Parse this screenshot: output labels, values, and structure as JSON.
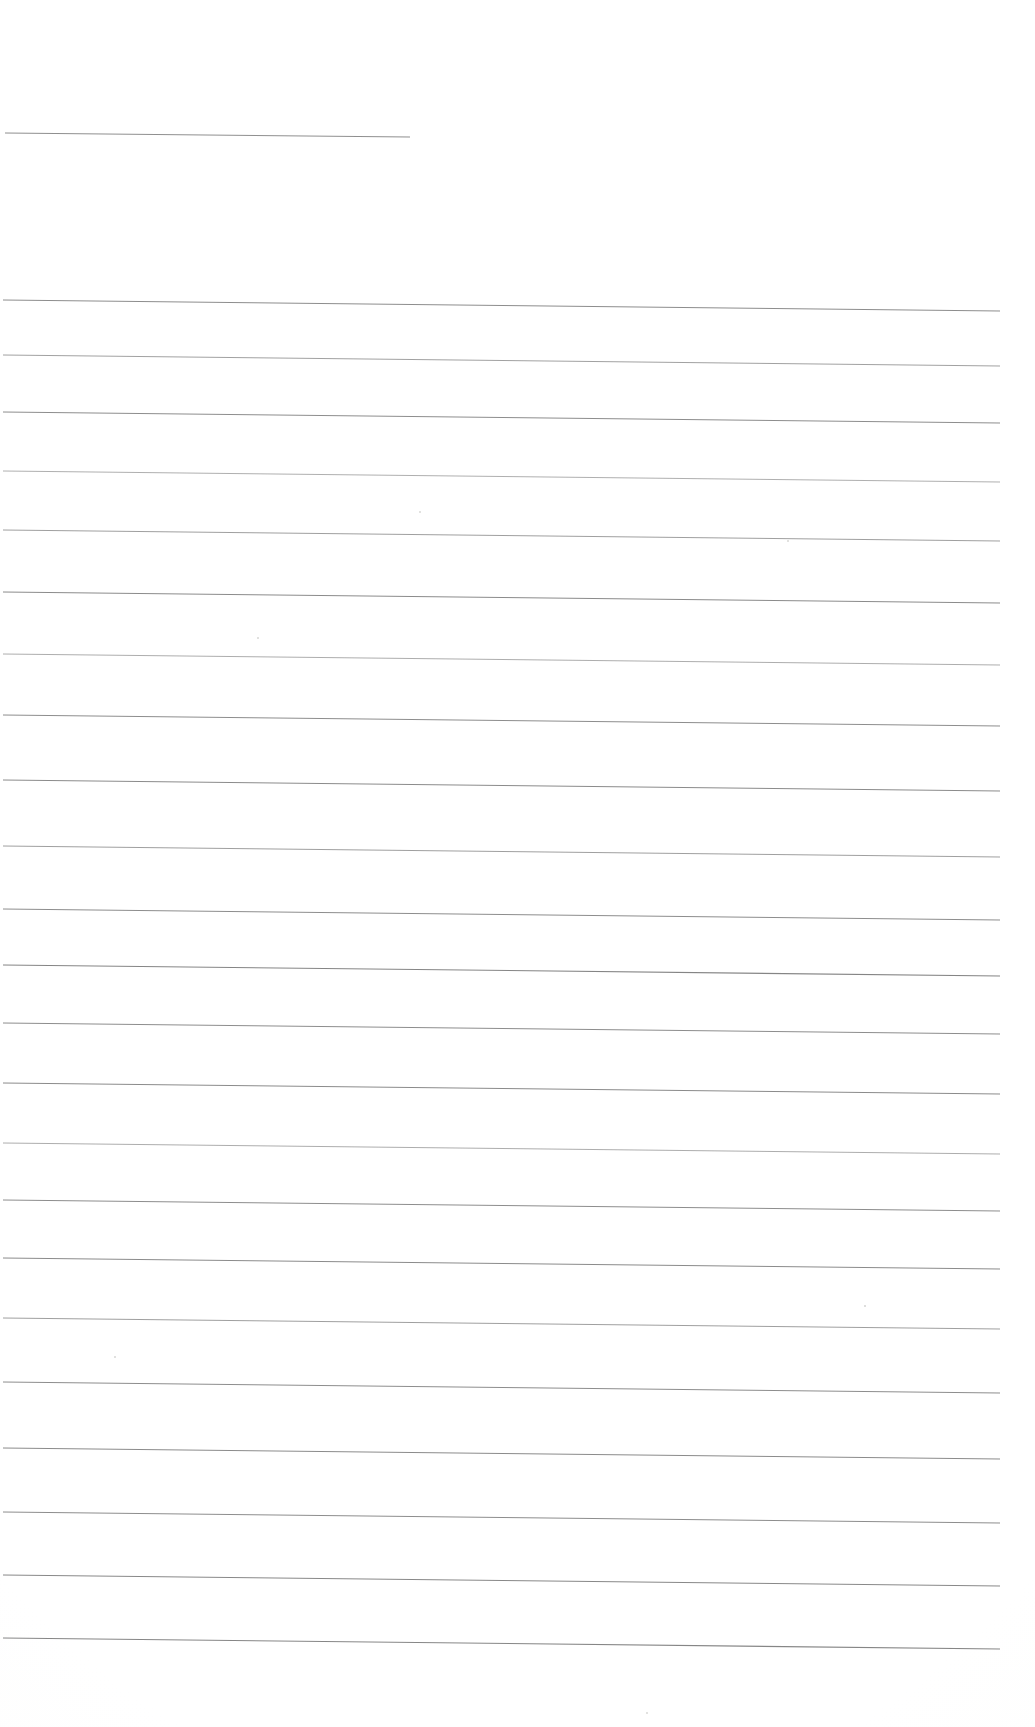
{
  "document": {
    "type": "scanned-lined-paper",
    "title": "Blank ruled notebook page (scan)",
    "page_width": 1035,
    "page_height": 1727,
    "background_color": "#fdfdfd",
    "paper_tone": "#fcfcfb",
    "content_text": "",
    "has_handwriting": false,
    "has_printed_text": false,
    "rule_line_color": "#8a8a8a",
    "rule_line_color_light": "#aeaeae",
    "rule_line_count": 23,
    "left_margin_x": 5,
    "right_edge_x": 1000,
    "nominal_line_spacing": 64
  },
  "ruled_lines": [
    {
      "index": 1,
      "x1": 5,
      "y1": 133,
      "x2": 410,
      "y2": 137,
      "weight": 1.15,
      "color": "#8f8f8f",
      "note": "short top rule"
    },
    {
      "index": 2,
      "x1": 3,
      "y1": 300,
      "x2": 1000,
      "y2": 311,
      "weight": 1.0,
      "color": "#8d8d8d"
    },
    {
      "index": 3,
      "x1": 3,
      "y1": 355,
      "x2": 1000,
      "y2": 366,
      "weight": 0.95,
      "color": "#9c9c9c"
    },
    {
      "index": 4,
      "x1": 3,
      "y1": 412,
      "x2": 1000,
      "y2": 423,
      "weight": 1.0,
      "color": "#8d8d8d"
    },
    {
      "index": 5,
      "x1": 3,
      "y1": 471,
      "x2": 1000,
      "y2": 482,
      "weight": 0.9,
      "color": "#a6a6a6"
    },
    {
      "index": 6,
      "x1": 3,
      "y1": 530,
      "x2": 1000,
      "y2": 541,
      "weight": 0.95,
      "color": "#9a9a9a"
    },
    {
      "index": 7,
      "x1": 3,
      "y1": 592,
      "x2": 1000,
      "y2": 603,
      "weight": 1.0,
      "color": "#8b8b8b"
    },
    {
      "index": 8,
      "x1": 3,
      "y1": 654,
      "x2": 1000,
      "y2": 665,
      "weight": 0.9,
      "color": "#a4a4a4"
    },
    {
      "index": 9,
      "x1": 3,
      "y1": 715,
      "x2": 1000,
      "y2": 726,
      "weight": 1.0,
      "color": "#8d8d8d"
    },
    {
      "index": 10,
      "x1": 3,
      "y1": 780,
      "x2": 1000,
      "y2": 791,
      "weight": 1.0,
      "color": "#8b8b8b"
    },
    {
      "index": 11,
      "x1": 3,
      "y1": 846,
      "x2": 1000,
      "y2": 857,
      "weight": 0.95,
      "color": "#9a9a9a"
    },
    {
      "index": 12,
      "x1": 3,
      "y1": 909,
      "x2": 1000,
      "y2": 920,
      "weight": 1.0,
      "color": "#8d8d8d"
    },
    {
      "index": 13,
      "x1": 3,
      "y1": 965,
      "x2": 1000,
      "y2": 976,
      "weight": 1.05,
      "color": "#858585"
    },
    {
      "index": 14,
      "x1": 3,
      "y1": 1023,
      "x2": 1000,
      "y2": 1034,
      "weight": 1.0,
      "color": "#8d8d8d"
    },
    {
      "index": 15,
      "x1": 3,
      "y1": 1083,
      "x2": 1000,
      "y2": 1094,
      "weight": 1.0,
      "color": "#8b8b8b"
    },
    {
      "index": 16,
      "x1": 3,
      "y1": 1143,
      "x2": 1000,
      "y2": 1154,
      "weight": 0.9,
      "color": "#a4a4a4"
    },
    {
      "index": 17,
      "x1": 3,
      "y1": 1200,
      "x2": 1000,
      "y2": 1211,
      "weight": 1.0,
      "color": "#8d8d8d"
    },
    {
      "index": 18,
      "x1": 3,
      "y1": 1258,
      "x2": 1000,
      "y2": 1269,
      "weight": 1.0,
      "color": "#8b8b8b"
    },
    {
      "index": 19,
      "x1": 3,
      "y1": 1318,
      "x2": 1000,
      "y2": 1329,
      "weight": 0.95,
      "color": "#9a9a9a"
    },
    {
      "index": 20,
      "x1": 3,
      "y1": 1382,
      "x2": 1000,
      "y2": 1393,
      "weight": 1.0,
      "color": "#8d8d8d"
    },
    {
      "index": 21,
      "x1": 3,
      "y1": 1448,
      "x2": 1000,
      "y2": 1459,
      "weight": 1.0,
      "color": "#8b8b8b"
    },
    {
      "index": 22,
      "x1": 3,
      "y1": 1512,
      "x2": 1000,
      "y2": 1523,
      "weight": 1.0,
      "color": "#8d8d8d"
    },
    {
      "index": 23,
      "x1": 3,
      "y1": 1575,
      "x2": 1000,
      "y2": 1586,
      "weight": 1.0,
      "color": "#888888"
    },
    {
      "index": 24,
      "x1": 3,
      "y1": 1638,
      "x2": 1000,
      "y2": 1649,
      "weight": 1.05,
      "color": "#868686"
    }
  ],
  "specks": [
    {
      "x": 419,
      "y": 511,
      "size": 2.2
    },
    {
      "x": 787,
      "y": 540,
      "size": 2.0
    },
    {
      "x": 257,
      "y": 637,
      "size": 1.8
    },
    {
      "x": 864,
      "y": 1305,
      "size": 1.6
    },
    {
      "x": 114,
      "y": 1356,
      "size": 1.8
    },
    {
      "x": 646,
      "y": 1712,
      "size": 2.0
    }
  ]
}
